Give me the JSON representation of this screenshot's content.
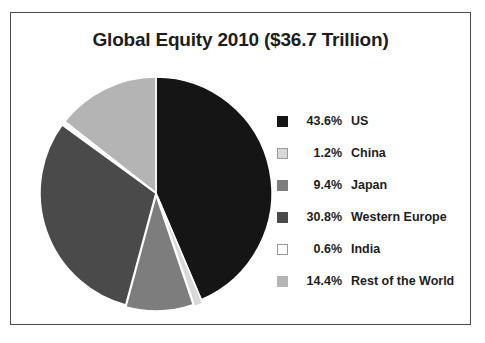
{
  "chart_data": {
    "type": "pie",
    "title": "Global Equity 2010 ($36.7 Trillion)",
    "xlabel": "",
    "ylabel": "",
    "legend_position": "right",
    "grid": false,
    "total_label": "$36.7 Trillion",
    "categories": [
      "US",
      "China",
      "Japan",
      "Western Europe",
      "India",
      "Rest of the World"
    ],
    "values": [
      43.6,
      1.2,
      9.4,
      30.8,
      0.6,
      14.4
    ],
    "value_labels": [
      "43.6%",
      "1.2%",
      "9.4%",
      "30.8%",
      "0.6%",
      "14.4%"
    ],
    "colors": [
      "#151515",
      "#d8d8d8",
      "#7d7d7d",
      "#4a4a4a",
      "#fdfdfd",
      "#b4b4b4"
    ],
    "slice_order": "clockwise-from-top",
    "exploded": true
  },
  "legend": {
    "items": [
      {
        "swatch": "legend-swatch-us",
        "percent": "43.6%",
        "label": "US",
        "color": "#151515"
      },
      {
        "swatch": "legend-swatch-china",
        "percent": "1.2%",
        "label": "China",
        "color": "#d8d8d8"
      },
      {
        "swatch": "legend-swatch-japan",
        "percent": "9.4%",
        "label": "Japan",
        "color": "#7d7d7d"
      },
      {
        "swatch": "legend-swatch-western-europe",
        "percent": "30.8%",
        "label": "Western Europe",
        "color": "#4a4a4a"
      },
      {
        "swatch": "legend-swatch-india",
        "percent": "0.6%",
        "label": "India",
        "color": "#fdfdfd"
      },
      {
        "swatch": "legend-swatch-rest-of-world",
        "percent": "14.4%",
        "label": "Rest of the World",
        "color": "#b4b4b4"
      }
    ]
  }
}
